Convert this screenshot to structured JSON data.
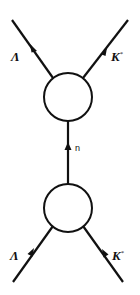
{
  "diagram": {
    "type": "feynman-diagram",
    "background": "#ffffff",
    "stroke_color": "#111111",
    "vertices": [
      {
        "id": "top-vertex",
        "cx": 68,
        "cy": 97,
        "r": 24
      },
      {
        "id": "bottom-vertex",
        "cx": 68,
        "cy": 208,
        "r": 24
      }
    ],
    "lines": [
      {
        "id": "top-left",
        "particle": "Lambda",
        "label": "Λ",
        "label_sup": "",
        "from": [
          12,
          20
        ],
        "to": [
          53,
          78
        ],
        "arrow_at": [
          33,
          48
        ],
        "arrow_dir": "up"
      },
      {
        "id": "top-right",
        "particle": "K-star",
        "label": "K",
        "label_sup": "*",
        "from": [
          83,
          78
        ],
        "to": [
          128,
          20
        ],
        "arrow_at": [
          104,
          52
        ],
        "arrow_dir": "up"
      },
      {
        "id": "internal",
        "particle": "n",
        "label": "n",
        "label_sup": "",
        "from": [
          68,
          184
        ],
        "to": [
          68,
          121
        ],
        "arrow_at": [
          68,
          146
        ],
        "arrow_dir": "up"
      },
      {
        "id": "bottom-left",
        "particle": "Lambda",
        "label": "Λ",
        "label_sup": "",
        "from": [
          13,
          282
        ],
        "to": [
          53,
          226
        ],
        "arrow_at": [
          31,
          252
        ],
        "arrow_dir": "up"
      },
      {
        "id": "bottom-right",
        "particle": "K-star",
        "label": "K",
        "label_sup": "*",
        "from": [
          123,
          282
        ],
        "to": [
          83,
          226
        ],
        "arrow_at": [
          105,
          253
        ],
        "arrow_dir": "up"
      }
    ],
    "labels": {
      "top_left": {
        "text": "Λ",
        "sup": ""
      },
      "top_right": {
        "text": "K",
        "sup": "*"
      },
      "internal": {
        "text": "n",
        "sup": ""
      },
      "bottom_left": {
        "text": "Λ",
        "sup": ""
      },
      "bottom_right": {
        "text": "K",
        "sup": "*"
      }
    }
  }
}
